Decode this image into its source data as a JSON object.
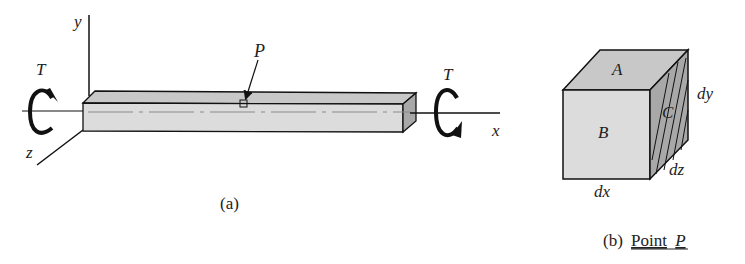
{
  "figure_a": {
    "caption": "(a)",
    "axes": {
      "x": "x",
      "y": "y",
      "z": "z"
    },
    "torque_left": "T",
    "torque_right": "T",
    "point_label": "P"
  },
  "figure_b": {
    "caption_prefix": "(b)",
    "caption_main": "Point",
    "caption_point": "P",
    "faces": {
      "top": "A",
      "front": "B",
      "side": "C"
    },
    "dims": {
      "dx": "dx",
      "dy": "dy",
      "dz": "dz"
    }
  },
  "colors": {
    "line": "#111111",
    "face_front": "#dcdcdc",
    "face_top": "#c8c8c8",
    "face_side": "#a8a8a8",
    "centerline": "#8a8a8a"
  }
}
